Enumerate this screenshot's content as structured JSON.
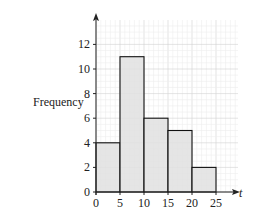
{
  "chart_data": {
    "type": "bar",
    "subtype": "histogram",
    "title": "",
    "xlabel": "t",
    "ylabel": "Frequency",
    "bins": [
      {
        "from": 0,
        "to": 5,
        "frequency": 4
      },
      {
        "from": 5,
        "to": 10,
        "frequency": 11
      },
      {
        "from": 10,
        "to": 15,
        "frequency": 6
      },
      {
        "from": 15,
        "to": 20,
        "frequency": 5
      },
      {
        "from": 20,
        "to": 25,
        "frequency": 2
      }
    ],
    "categories": [
      "0-5",
      "5-10",
      "10-15",
      "15-20",
      "20-25"
    ],
    "values": [
      4,
      11,
      6,
      5,
      2
    ],
    "x_ticks": [
      0,
      5,
      10,
      15,
      20,
      25
    ],
    "y_ticks": [
      0,
      2,
      4,
      6,
      8,
      10,
      12
    ],
    "xlim": [
      0,
      29.5
    ],
    "ylim": [
      0,
      14
    ],
    "grid": true,
    "legend": null,
    "colors": {
      "bar_fill": "#e0e0e0",
      "bar_stroke": "#111111",
      "grid_minor": "#ececec",
      "grid_major": "#d2d2d2",
      "axis": "#222222"
    }
  },
  "labels": {
    "y_axis_title": "Frequency",
    "x_axis_title": "t"
  }
}
